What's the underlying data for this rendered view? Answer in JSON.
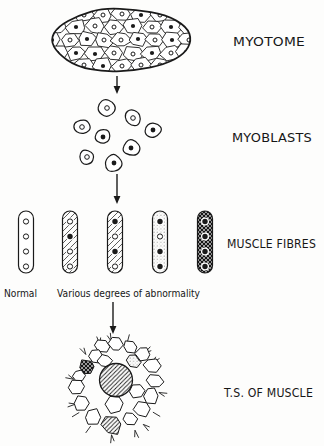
{
  "colors": {
    "ink": "#1a1a1a",
    "paper": "#ffffff"
  },
  "labels": {
    "myotome": "MYOTOME",
    "myoblasts": "MYOBLASTS",
    "muscle_fibres": "MUSCLE FIBRES",
    "ts_of_muscle": "T.S. OF MUSCLE",
    "normal": "Normal",
    "abnormal": "Various degrees of abnormality"
  },
  "myotome": {
    "outline": {
      "cx": 121,
      "cy": 40,
      "rx": 72,
      "ry": 32
    },
    "cells": [
      {
        "x": 84,
        "y": 15,
        "n": "o"
      },
      {
        "x": 103,
        "y": 15,
        "n": "o"
      },
      {
        "x": 122,
        "y": 14,
        "n": "o"
      },
      {
        "x": 141,
        "y": 15,
        "n": "f"
      },
      {
        "x": 160,
        "y": 15,
        "n": "o"
      },
      {
        "x": 57,
        "y": 27,
        "n": "o"
      },
      {
        "x": 76,
        "y": 27,
        "n": "f"
      },
      {
        "x": 95,
        "y": 26,
        "n": "o"
      },
      {
        "x": 114,
        "y": 27,
        "n": "o"
      },
      {
        "x": 133,
        "y": 26,
        "n": "f"
      },
      {
        "x": 152,
        "y": 27,
        "n": "o"
      },
      {
        "x": 171,
        "y": 27,
        "n": "f"
      },
      {
        "x": 188,
        "y": 28,
        "n": "o"
      },
      {
        "x": 52,
        "y": 40,
        "n": "f"
      },
      {
        "x": 70,
        "y": 40,
        "n": "o"
      },
      {
        "x": 87,
        "y": 39,
        "n": "f"
      },
      {
        "x": 104,
        "y": 40,
        "n": "o"
      },
      {
        "x": 121,
        "y": 40,
        "n": "o"
      },
      {
        "x": 138,
        "y": 39,
        "n": "f"
      },
      {
        "x": 155,
        "y": 40,
        "n": "o"
      },
      {
        "x": 172,
        "y": 40,
        "n": "f"
      },
      {
        "x": 189,
        "y": 40,
        "n": "o"
      },
      {
        "x": 57,
        "y": 53,
        "n": "o"
      },
      {
        "x": 76,
        "y": 53,
        "n": "f"
      },
      {
        "x": 95,
        "y": 54,
        "n": "f"
      },
      {
        "x": 114,
        "y": 53,
        "n": "o"
      },
      {
        "x": 133,
        "y": 54,
        "n": "o"
      },
      {
        "x": 152,
        "y": 53,
        "n": "f"
      },
      {
        "x": 171,
        "y": 53,
        "n": "o"
      },
      {
        "x": 186,
        "y": 52,
        "n": "f"
      },
      {
        "x": 84,
        "y": 65,
        "n": "o"
      },
      {
        "x": 103,
        "y": 66,
        "n": "f"
      },
      {
        "x": 122,
        "y": 66,
        "n": "o"
      },
      {
        "x": 141,
        "y": 65,
        "n": "o"
      },
      {
        "x": 160,
        "y": 65,
        "n": "o"
      }
    ]
  },
  "myoblasts": {
    "cells": [
      {
        "x": 107,
        "y": 108,
        "r": 10,
        "n": "o"
      },
      {
        "x": 82,
        "y": 127,
        "r": 8.5,
        "n": "o"
      },
      {
        "x": 133,
        "y": 118,
        "r": 9,
        "n": "o"
      },
      {
        "x": 153,
        "y": 130,
        "r": 9,
        "n": "f"
      },
      {
        "x": 103,
        "y": 137,
        "r": 8.5,
        "n": "f"
      },
      {
        "x": 131,
        "y": 148,
        "r": 9,
        "n": "f"
      },
      {
        "x": 87,
        "y": 157,
        "r": 8,
        "n": "o"
      },
      {
        "x": 114,
        "y": 163,
        "r": 9.5,
        "n": "f"
      }
    ]
  },
  "muscle_fibres": {
    "top": 211,
    "height": 62,
    "width": 15,
    "nuclei_y": [
      221.5,
      236.5,
      251.5,
      266.5
    ],
    "fibres": [
      {
        "cx": 26,
        "hatch": "none",
        "nuclei": [
          "o",
          "o",
          "o",
          "o"
        ]
      },
      {
        "cx": 70,
        "hatch": "light",
        "nuclei": [
          "o",
          "f",
          "o",
          "o"
        ]
      },
      {
        "cx": 115,
        "hatch": "light",
        "nuclei": [
          "f",
          "o",
          "f",
          "o"
        ]
      },
      {
        "cx": 160,
        "hatch": "stipple",
        "nuclei": [
          "f",
          "o",
          "f",
          "f"
        ]
      },
      {
        "cx": 205,
        "hatch": "dark",
        "nuclei": [
          "f",
          "f",
          "f",
          "f"
        ]
      }
    ]
  },
  "ts_muscle": {
    "center": {
      "x": 116,
      "y": 388
    },
    "cells": [
      {
        "x": 102,
        "y": 346,
        "r": 7,
        "fill": "plain"
      },
      {
        "x": 116,
        "y": 344,
        "r": 7,
        "fill": "plain"
      },
      {
        "x": 130,
        "y": 347,
        "r": 7,
        "fill": "plain"
      },
      {
        "x": 143,
        "y": 354,
        "r": 7.5,
        "fill": "plain"
      },
      {
        "x": 152,
        "y": 366,
        "r": 8,
        "fill": "plain"
      },
      {
        "x": 155,
        "y": 381,
        "r": 8,
        "fill": "plain"
      },
      {
        "x": 151,
        "y": 396,
        "r": 8,
        "fill": "plain"
      },
      {
        "x": 142,
        "y": 409,
        "r": 8,
        "fill": "plain"
      },
      {
        "x": 130,
        "y": 419,
        "r": 7.5,
        "fill": "plain"
      },
      {
        "x": 93,
        "y": 417,
        "r": 8.5,
        "fill": "plain"
      },
      {
        "x": 81,
        "y": 403,
        "r": 8,
        "fill": "plain"
      },
      {
        "x": 76,
        "y": 387,
        "r": 7.5,
        "fill": "plain"
      },
      {
        "x": 79,
        "y": 376,
        "r": 6.5,
        "fill": "plain"
      },
      {
        "x": 96,
        "y": 356,
        "r": 7.5,
        "fill": "plain"
      },
      {
        "x": 105,
        "y": 361,
        "r": 7,
        "fill": "plain"
      },
      {
        "x": 115,
        "y": 404,
        "r": 9.5,
        "fill": "plain"
      },
      {
        "x": 137,
        "y": 391,
        "r": 8.5,
        "fill": "plain"
      },
      {
        "x": 133,
        "y": 361,
        "r": 7.5,
        "fill": "stipple"
      },
      {
        "x": 87,
        "y": 367,
        "r": 8,
        "fill": "dark"
      },
      {
        "x": 112,
        "y": 425,
        "r": 10,
        "fill": "hatch"
      },
      {
        "x": 116,
        "y": 380,
        "r": 16.5,
        "fill": "hatch",
        "shape": "circle"
      }
    ]
  },
  "arrows": [
    {
      "x": 117,
      "y1": 76,
      "y2": 94
    },
    {
      "x": 117,
      "y1": 174,
      "y2": 204
    },
    {
      "x": 113,
      "y1": 302,
      "y2": 334
    }
  ]
}
